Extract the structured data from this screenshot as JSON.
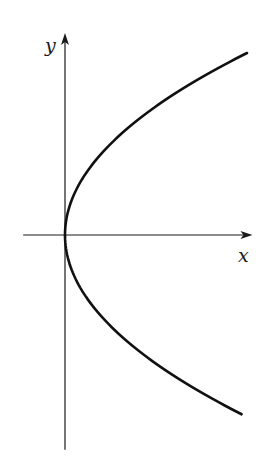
{
  "chart_data": {
    "type": "line",
    "title": "",
    "xlabel": "x",
    "ylabel": "y",
    "equation": "x = y^2",
    "series": [
      {
        "name": "parabola",
        "function": "x = y^2",
        "y_range": [
          -0.985,
          1.0
        ]
      }
    ],
    "xlim": [
      -0.23,
      1.03
    ],
    "ylim": [
      -1.18,
      1.11
    ],
    "grid": false,
    "legend": "none"
  },
  "labels": {
    "x_axis": "x",
    "y_axis": "y"
  },
  "colors": {
    "ink": "#111111",
    "background": "#ffffff"
  }
}
